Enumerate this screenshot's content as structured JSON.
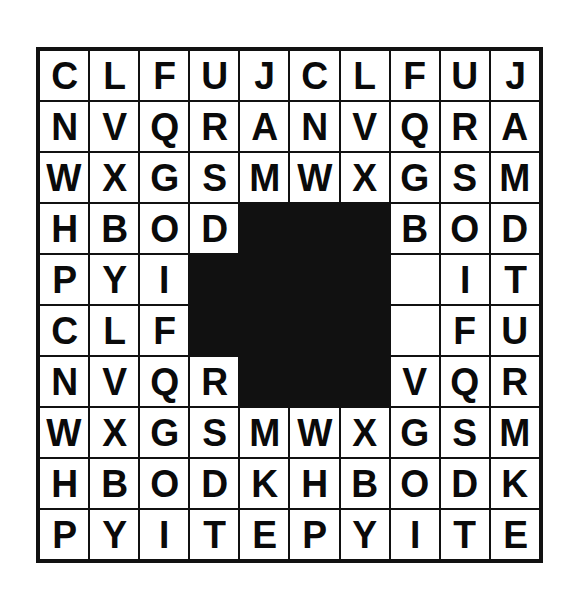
{
  "puzzle": {
    "title": "Letter Grid",
    "rows": 10,
    "columns": 10,
    "background_color": "#ffffff",
    "cell_fill_color": "#ffffff",
    "blocked_cell_color": "#111111",
    "grid_line_color": "#111111",
    "letter_color": "#0a0a0a",
    "grid": [
      [
        "C",
        "L",
        "F",
        "U",
        "J",
        "C",
        "L",
        "F",
        "U",
        "J"
      ],
      [
        "N",
        "V",
        "Q",
        "R",
        "A",
        "N",
        "V",
        "Q",
        "R",
        "A"
      ],
      [
        "W",
        "X",
        "G",
        "S",
        "M",
        "W",
        "X",
        "G",
        "S",
        "M"
      ],
      [
        "H",
        "B",
        "O",
        "D",
        "",
        "",
        "",
        "B",
        "O",
        "D"
      ],
      [
        "P",
        "Y",
        "I",
        "",
        "",
        "",
        "",
        "",
        "I",
        "T"
      ],
      [
        "C",
        "L",
        "F",
        "",
        "",
        "",
        "",
        "",
        "F",
        "U"
      ],
      [
        "N",
        "V",
        "Q",
        "R",
        "",
        "",
        "",
        "V",
        "Q",
        "R"
      ],
      [
        "W",
        "X",
        "G",
        "S",
        "M",
        "W",
        "X",
        "G",
        "S",
        "M"
      ],
      [
        "H",
        "B",
        "O",
        "D",
        "K",
        "H",
        "B",
        "O",
        "D",
        "K"
      ],
      [
        "P",
        "Y",
        "I",
        "T",
        "E",
        "P",
        "Y",
        "I",
        "T",
        "E"
      ]
    ],
    "blocked": [
      [
        false,
        false,
        false,
        false,
        false,
        false,
        false,
        false,
        false,
        false
      ],
      [
        false,
        false,
        false,
        false,
        false,
        false,
        false,
        false,
        false,
        false
      ],
      [
        false,
        false,
        false,
        false,
        false,
        false,
        false,
        false,
        false,
        false
      ],
      [
        false,
        false,
        false,
        false,
        true,
        true,
        true,
        false,
        false,
        false
      ],
      [
        false,
        false,
        false,
        true,
        true,
        true,
        true,
        false,
        false,
        false
      ],
      [
        false,
        false,
        false,
        true,
        true,
        true,
        true,
        false,
        false,
        false
      ],
      [
        false,
        false,
        false,
        false,
        true,
        true,
        true,
        false,
        false,
        false
      ],
      [
        false,
        false,
        false,
        false,
        false,
        false,
        false,
        false,
        false,
        false
      ],
      [
        false,
        false,
        false,
        false,
        false,
        false,
        false,
        false,
        false,
        false
      ],
      [
        false,
        false,
        false,
        false,
        false,
        false,
        false,
        false,
        false,
        false
      ]
    ],
    "row_labels": [
      "CLFUJCLFUJ",
      "NVQRANVQRA",
      "WXGSMWXGSM",
      "HBOD___BOD",
      "PYI_____ITE",
      "CLF_____FUJ",
      "NVQR___VQRA",
      "WXGSMWXGSM",
      "HBODKHBODK",
      "PYITEPYITE"
    ]
  }
}
